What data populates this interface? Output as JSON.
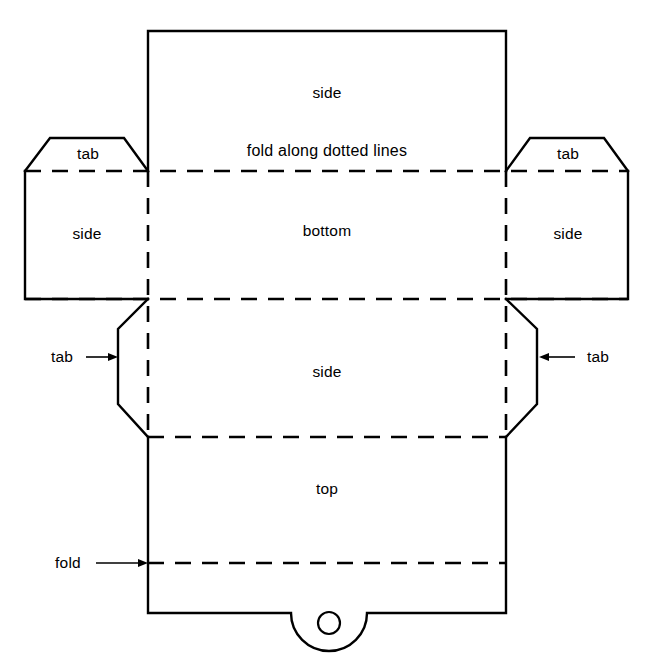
{
  "diagram": {
    "instruction": "fold along dotted lines",
    "background_color": "#ffffff",
    "line_color": "#000000",
    "panels": [
      {
        "id": "side-top",
        "label": "side",
        "cx": 327,
        "cy": 93
      },
      {
        "id": "tab-top-left",
        "label": "tab",
        "cx": 88,
        "cy": 154
      },
      {
        "id": "tab-top-right",
        "label": "tab",
        "cx": 568,
        "cy": 154
      },
      {
        "id": "side-left",
        "label": "side",
        "cx": 87,
        "cy": 234
      },
      {
        "id": "bottom",
        "label": "bottom",
        "cx": 327,
        "cy": 231
      },
      {
        "id": "side-right",
        "label": "side",
        "cx": 568,
        "cy": 234
      },
      {
        "id": "side-middle",
        "label": "side",
        "cx": 327,
        "cy": 372
      },
      {
        "id": "top",
        "label": "top",
        "cx": 327,
        "cy": 489
      }
    ],
    "callouts": [
      {
        "id": "tab-left-callout",
        "label": "tab",
        "lx": 62,
        "ly": 357,
        "direction": "right"
      },
      {
        "id": "tab-right-callout",
        "label": "tab",
        "lx": 598,
        "ly": 357,
        "direction": "left"
      },
      {
        "id": "fold-callout",
        "label": "fold",
        "lx": 68,
        "ly": 563,
        "direction": "right"
      }
    ],
    "fold_lines": {
      "horizontal_y": [
        171,
        299,
        437,
        563
      ],
      "vertical_x": [
        148,
        506
      ],
      "style": "dashed"
    },
    "geometry": {
      "body_left": 148,
      "body_right": 506,
      "top_panel_top": 31,
      "side_flap_left": 25,
      "side_flap_right": 628,
      "bottom_edge": 613,
      "notch_center_x": 329,
      "notch_radius": 38,
      "hole_radius": 11
    }
  }
}
